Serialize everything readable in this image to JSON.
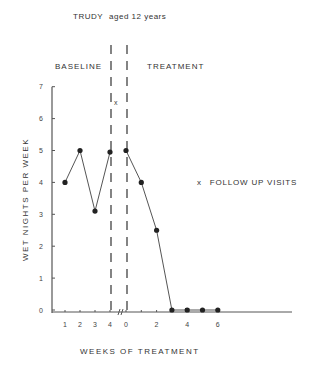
{
  "title": "TRUDY",
  "subtitle": "aged 12 years",
  "phases": {
    "baseline": "BASELINE",
    "treatment": "TREATMENT"
  },
  "ylabel": "WET NIGHTS PER WEEK",
  "xlabel": "WEEKS OF TREATMENT",
  "legend": {
    "marker": "x",
    "label": "FOLLOW UP VISITS"
  },
  "chart_data": {
    "type": "line",
    "xlabel": "WEEKS OF TREATMENT",
    "ylabel": "WET NIGHTS PER WEEK",
    "ylim": [
      0,
      7
    ],
    "yticks": [
      "0",
      "1",
      "2",
      "3",
      "4",
      "5",
      "6",
      "7"
    ],
    "xticks_baseline": [
      "1",
      "2",
      "3",
      "4"
    ],
    "xticks_treatment": [
      "0",
      "2",
      "4",
      "6"
    ],
    "grid": false,
    "phase_labels": [
      "BASELINE",
      "TREATMENT"
    ],
    "series": [
      {
        "name": "Baseline",
        "x": [
          1,
          2,
          3,
          4
        ],
        "values": [
          4,
          5,
          3.1,
          4.95
        ]
      },
      {
        "name": "Treatment",
        "x": [
          0,
          1,
          2,
          3,
          4,
          5,
          6
        ],
        "values": [
          5,
          4,
          2.5,
          0,
          0,
          0,
          0
        ]
      }
    ],
    "follow_up_visits": [
      {
        "week": 4,
        "value": 0
      }
    ],
    "legend": [
      "x FOLLOW UP VISITS"
    ],
    "annotations": [
      "phase change dashed lines between baseline week 4 and treatment week 0",
      "axis break between 4 and 0"
    ]
  }
}
